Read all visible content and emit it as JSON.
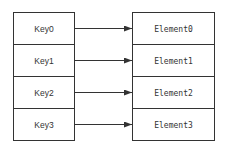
{
  "diagram": {
    "type": "key-to-element mapping",
    "keys": [
      {
        "label": "Key0"
      },
      {
        "label": "Key1"
      },
      {
        "label": "Key2"
      },
      {
        "label": "Key3"
      }
    ],
    "elements": [
      {
        "label": "Element0"
      },
      {
        "label": "Element1"
      },
      {
        "label": "Element2"
      },
      {
        "label": "Element3"
      }
    ],
    "edges": [
      {
        "from": "Key0",
        "to": "Element0"
      },
      {
        "from": "Key1",
        "to": "Element1"
      },
      {
        "from": "Key2",
        "to": "Element2"
      },
      {
        "from": "Key3",
        "to": "Element3"
      }
    ],
    "colors": {
      "stroke": "#333333",
      "text": "#333333",
      "background": "#ffffff"
    }
  }
}
